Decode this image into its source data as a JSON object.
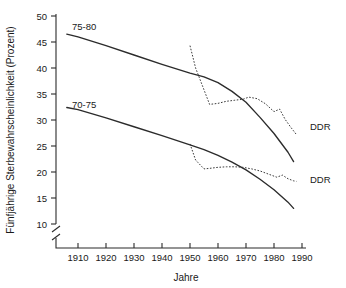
{
  "chart_data": {
    "type": "line",
    "title": "",
    "xlabel": "Jahre",
    "ylabel": "Fünfjährige Sterbewahrscheinlichkeit (Prozent)",
    "xlim": [
      1900,
      1990
    ],
    "ylim": [
      8,
      50
    ],
    "y_axis_break": true,
    "y_break_note": "axis broken below 10",
    "grid": false,
    "legend_position": "inline-annotations",
    "x_ticks": [
      1910,
      1920,
      1930,
      1940,
      1950,
      1960,
      1970,
      1980,
      1990
    ],
    "y_ticks": [
      10,
      15,
      20,
      25,
      30,
      35,
      40,
      45,
      50
    ],
    "annotations": [
      {
        "text": "75-80",
        "x": 1925,
        "y": 46.0
      },
      {
        "text": "70-75",
        "x": 1925,
        "y": 32.0
      },
      {
        "text": "DDR",
        "x": 1992,
        "y": 30.5
      },
      {
        "text": "DDR",
        "x": 1992,
        "y": 18.3
      }
    ],
    "series": [
      {
        "name": "75-80 trend (solid)",
        "style": "solid",
        "x": [
          1906,
          1910,
          1920,
          1930,
          1940,
          1950,
          1955,
          1960,
          1965,
          1970,
          1975,
          1980,
          1985,
          1987
        ],
        "values": [
          46.5,
          46.0,
          44.3,
          42.5,
          40.7,
          39.0,
          38.3,
          37.2,
          35.5,
          33.4,
          30.5,
          27.4,
          23.8,
          22.0
        ]
      },
      {
        "name": "75-80 DDR (dotted)",
        "style": "dotted",
        "x": [
          1950,
          1952,
          1955,
          1957,
          1960,
          1963,
          1966,
          1969,
          1971,
          1974,
          1977,
          1980,
          1982,
          1984,
          1986,
          1988
        ],
        "values": [
          44.3,
          40.0,
          35.8,
          33.0,
          33.2,
          33.6,
          33.8,
          34.0,
          34.4,
          34.1,
          33.1,
          31.6,
          32.1,
          30.1,
          28.6,
          27.2
        ]
      },
      {
        "name": "70-75 trend (solid)",
        "style": "solid",
        "x": [
          1906,
          1910,
          1920,
          1930,
          1940,
          1950,
          1955,
          1960,
          1965,
          1970,
          1975,
          1980,
          1985,
          1987
        ],
        "values": [
          32.4,
          32.0,
          30.4,
          28.7,
          27.0,
          25.2,
          24.3,
          23.2,
          21.9,
          20.4,
          18.6,
          16.6,
          14.2,
          13.0
        ]
      },
      {
        "name": "70-75 DDR (dotted)",
        "style": "dotted",
        "x": [
          1950,
          1952,
          1955,
          1957,
          1960,
          1963,
          1966,
          1969,
          1972,
          1975,
          1978,
          1981,
          1983,
          1985,
          1987,
          1988
        ],
        "values": [
          25.4,
          22.3,
          20.6,
          20.7,
          20.9,
          21.0,
          21.0,
          20.9,
          20.6,
          20.2,
          19.6,
          19.0,
          19.4,
          18.7,
          18.3,
          18.2
        ]
      }
    ]
  },
  "axis": {
    "x_tick_labels": [
      "1910",
      "1920",
      "1930",
      "1940",
      "1950",
      "1960",
      "1970",
      "1980",
      "1990"
    ],
    "y_tick_labels": [
      "10",
      "15",
      "20",
      "25",
      "30",
      "35",
      "40",
      "45",
      "50"
    ],
    "x_title": "Jahre",
    "y_title": "Fünfjährige Sterbewahrscheinlichkeit (Prozent)"
  },
  "labels": {
    "series_upper": "75-80",
    "series_lower": "70-75",
    "ddr_upper": "DDR",
    "ddr_lower": "DDR"
  },
  "colors": {
    "ink": "#2b2b2b",
    "background": "#ffffff"
  }
}
